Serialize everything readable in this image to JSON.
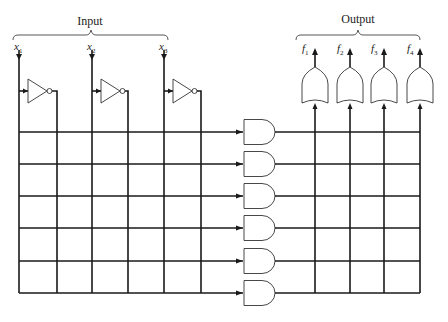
{
  "diagram": {
    "input_label": "Input",
    "output_label": "Output",
    "inputs": [
      {
        "name": "x",
        "sub": "1",
        "x": 19
      },
      {
        "name": "x",
        "sub": "2",
        "x": 92
      },
      {
        "name": "x",
        "sub": "3",
        "x": 164
      }
    ],
    "outputs": [
      {
        "name": "f",
        "sub": "1",
        "x": 315
      },
      {
        "name": "f",
        "sub": "2",
        "x": 350
      },
      {
        "name": "f",
        "sub": "3",
        "x": 384
      },
      {
        "name": "f",
        "sub": "4",
        "x": 420
      }
    ],
    "inverter_count": 3,
    "and_gate_count": 6,
    "or_gate_count": 4,
    "and_plane_columns_x": [
      19,
      57,
      92,
      128,
      164,
      201
    ],
    "product_rows_y": [
      132,
      164,
      196,
      228,
      261,
      293
    ],
    "or_plane_columns_x": [
      315,
      350,
      384,
      420
    ]
  }
}
